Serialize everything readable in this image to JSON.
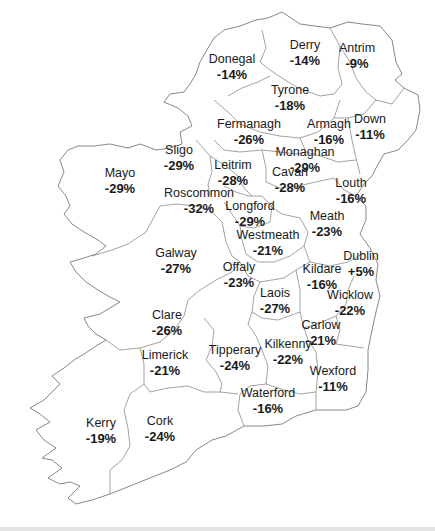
{
  "map": {
    "region": "Ireland",
    "counties": [
      {
        "name": "Donegal",
        "value": "-14%",
        "x": 232,
        "y": 66
      },
      {
        "name": "Derry",
        "value": "-14%",
        "x": 305,
        "y": 52
      },
      {
        "name": "Antrim",
        "value": "-9%",
        "x": 357,
        "y": 55
      },
      {
        "name": "Tyrone",
        "value": "-18%",
        "x": 290,
        "y": 97
      },
      {
        "name": "Fermanagh",
        "value": "-26%",
        "x": 249,
        "y": 131
      },
      {
        "name": "Armagh",
        "value": "-16%",
        "x": 329,
        "y": 131
      },
      {
        "name": "Down",
        "value": "-11%",
        "x": 370,
        "y": 126
      },
      {
        "name": "Sligo",
        "value": "-29%",
        "x": 179,
        "y": 157
      },
      {
        "name": "Monaghan",
        "value": "-29%",
        "x": 305,
        "y": 159
      },
      {
        "name": "Leitrim",
        "value": "-28%",
        "x": 233,
        "y": 172
      },
      {
        "name": "Cavan",
        "value": "-28%",
        "x": 290,
        "y": 179
      },
      {
        "name": "Louth",
        "value": "-16%",
        "x": 351,
        "y": 190
      },
      {
        "name": "Mayo",
        "value": "-29%",
        "x": 120,
        "y": 180
      },
      {
        "name": "Roscommon",
        "value": "-32%",
        "x": 199,
        "y": 200
      },
      {
        "name": "Longford",
        "value": "-29%",
        "x": 250,
        "y": 213
      },
      {
        "name": "Meath",
        "value": "-23%",
        "x": 327,
        "y": 223
      },
      {
        "name": "Westmeath",
        "value": "-21%",
        "x": 268,
        "y": 242
      },
      {
        "name": "Galway",
        "value": "-27%",
        "x": 176,
        "y": 260
      },
      {
        "name": "Dublin",
        "value": "+5%",
        "x": 361,
        "y": 263
      },
      {
        "name": "Offaly",
        "value": "-23%",
        "x": 239,
        "y": 274
      },
      {
        "name": "Kildare",
        "value": "-16%",
        "x": 322,
        "y": 276
      },
      {
        "name": "Laois",
        "value": "-27%",
        "x": 275,
        "y": 300
      },
      {
        "name": "Wicklow",
        "value": "-22%",
        "x": 350,
        "y": 302
      },
      {
        "name": "Clare",
        "value": "-26%",
        "x": 167,
        "y": 322
      },
      {
        "name": "Carlow",
        "value": "-21%",
        "x": 321,
        "y": 332
      },
      {
        "name": "Tipperary",
        "value": "-24%",
        "x": 235,
        "y": 357
      },
      {
        "name": "Limerick",
        "value": "-21%",
        "x": 165,
        "y": 362
      },
      {
        "name": "Kilkenny",
        "value": "-22%",
        "x": 288,
        "y": 351
      },
      {
        "name": "Wexford",
        "value": "-11%",
        "x": 333,
        "y": 378
      },
      {
        "name": "Waterford",
        "value": "-16%",
        "x": 268,
        "y": 400
      },
      {
        "name": "Kerry",
        "value": "-19%",
        "x": 101,
        "y": 430
      },
      {
        "name": "Cork",
        "value": "-24%",
        "x": 160,
        "y": 428
      }
    ]
  }
}
